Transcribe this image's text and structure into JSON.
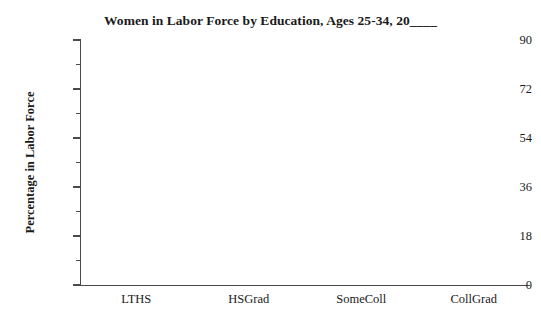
{
  "chart_data": {
    "type": "bar",
    "title": "Women in Labor Force by Education, Ages 25-34, 20____",
    "xlabel": "",
    "ylabel": "Percentage in Labor Force",
    "categories": [
      "LTHS",
      "HSGrad",
      "SomeColl",
      "CollGrad"
    ],
    "values": [
      null,
      null,
      null,
      null
    ],
    "series": [],
    "ylim": [
      0,
      90
    ],
    "y_major_ticks": [
      0,
      18,
      36,
      54,
      72,
      90
    ],
    "y_major_tick_labels": [
      "0",
      "18",
      "36",
      "54",
      "72",
      "90"
    ],
    "y_minor_ticks": [
      9,
      27,
      45,
      63,
      81
    ],
    "grid": false,
    "legend": false,
    "legend_position": "none",
    "annotations": [],
    "note": "Blank template chart: plot area contains no plotted data."
  },
  "axis_colors": {
    "axis_line": "#4a4a4a",
    "text": "#1a1a1a",
    "background": "#ffffff"
  }
}
